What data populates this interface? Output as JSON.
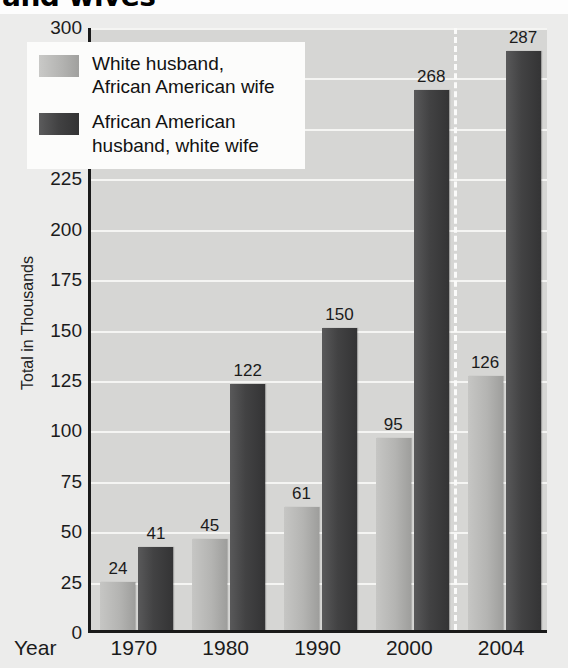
{
  "title": {
    "text": "and wives",
    "cropped": true
  },
  "chart_data": {
    "type": "bar",
    "title": "and wives",
    "xlabel": "Year",
    "ylabel": "Total in Thousands",
    "categories": [
      "1970",
      "1980",
      "1990",
      "2000",
      "2004"
    ],
    "series": [
      {
        "name": "White husband, African American wife",
        "color": "#b4b4b2",
        "values": [
          24,
          45,
          61,
          95,
          126
        ]
      },
      {
        "name": "African American husband, white wife",
        "color": "#424243",
        "values": [
          41,
          122,
          150,
          268,
          287
        ]
      }
    ],
    "ylim": [
      0,
      300
    ],
    "yticks": [
      0,
      25,
      50,
      75,
      100,
      125,
      150,
      175,
      200,
      225,
      250,
      275,
      300
    ],
    "grid": true,
    "legend_position": "top-left",
    "annotations": [
      {
        "type": "vertical-dashed-divider",
        "between": [
          "2000",
          "2004"
        ]
      }
    ],
    "plot_background": "#d6d6d4",
    "gridline_color": "#f5f5f3"
  },
  "legend": {
    "entries": [
      {
        "label_line1": "White husband,",
        "label_line2": "African American wife",
        "swatch": "light"
      },
      {
        "label_line1": "African American",
        "label_line2": "husband, white wife",
        "swatch": "dark"
      }
    ]
  },
  "axes": {
    "y_title": "Total in Thousands",
    "x_title": "Year",
    "y_ticks": [
      "300",
      "275",
      "250",
      "225",
      "200",
      "175",
      "150",
      "125",
      "100",
      "75",
      "50",
      "25",
      "0"
    ],
    "x_ticks": [
      "1970",
      "1980",
      "1990",
      "2000",
      "2004"
    ]
  },
  "bar_labels": [
    "24",
    "41",
    "45",
    "122",
    "61",
    "150",
    "95",
    "268",
    "126",
    "287"
  ]
}
